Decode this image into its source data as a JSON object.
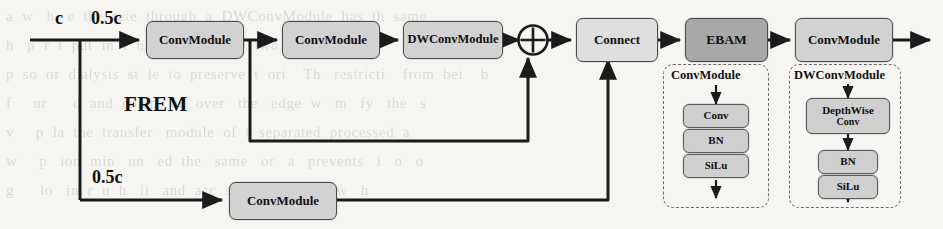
{
  "figure": {
    "module_name": "FREM",
    "background_color": "#f6f5f2",
    "accent_dark": "#a8a8a8",
    "accent_light": "#d2d2d2"
  },
  "labels": {
    "input_channels": "c",
    "branch_top_channels": "0.5c",
    "branch_bottom_channels": "0.5c",
    "module_label": "FREM"
  },
  "nodes": {
    "conv_top_1": "ConvModule",
    "conv_top_2": "ConvModule",
    "dwconv_top": "DWConvModule",
    "connect": "Connect",
    "ebam": "EBAM",
    "conv_out": "ConvModule",
    "conv_bottom": "ConvModule",
    "add_symbol": "⊕"
  },
  "legend": {
    "conv_module": {
      "title": "ConvModule",
      "layers": [
        "Conv",
        "BN",
        "SiLu"
      ]
    },
    "dwconv_module": {
      "title": "DWConvModule",
      "layers_line1": "DepthWise",
      "layers_line2": "Conv",
      "layers": [
        "BN",
        "SiLu"
      ]
    }
  },
  "background_text": {
    "line1": "a  w   h   e  the  rate  through  a  DWConvModule  has  th  same",
    "line2": "h   p  r  t  put  in  t  u  i  t  i  produce  two  distinct",
    "line3": "p  so  or  dialysis  st  le  to  preserve  t  ori    Th   restricti    from  bei    b",
    "line4": "f     ur      d  and  comp   on  over   the   edge  w   m   fy   the   s",
    "line5": "v     p  la  the  transfer   module  of  t  separated  processed  a",
    "line6": "w     p   ion  min   un   ed  the   same   or   a   prevents   i   o   o",
    "line7": "g      lo   in  r  u  h   li   and  acc  ss   of   the   m   w   h"
  }
}
